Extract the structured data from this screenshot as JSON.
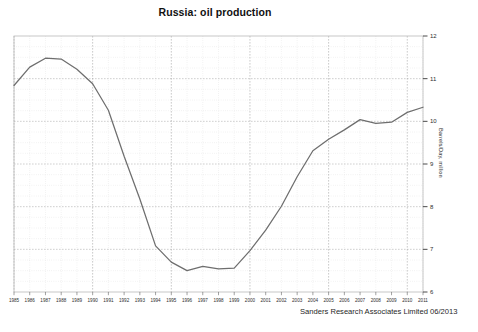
{
  "chart_data": {
    "type": "line",
    "title": "Russia: oil production",
    "xlabel": "",
    "ylabel": "Barrels/Day, million",
    "ylim": [
      6,
      12
    ],
    "xlim": [
      1985,
      2011
    ],
    "ytick_labels": [
      "6",
      "7",
      "8",
      "9",
      "10",
      "11",
      "12"
    ],
    "yticks": [
      6,
      7,
      8,
      9,
      10,
      11,
      12
    ],
    "grid": true,
    "grid_minor": true,
    "legend": "none",
    "series_color": "#6e6e6e",
    "x": [
      1985,
      1986,
      1987,
      1988,
      1989,
      1990,
      1991,
      1992,
      1993,
      1994,
      1995,
      1996,
      1997,
      1998,
      1999,
      2000,
      2001,
      2002,
      2003,
      2004,
      2005,
      2006,
      2007,
      2008,
      2009,
      2010,
      2011
    ],
    "categories": [
      "1985",
      "1986",
      "1987",
      "1988",
      "1989",
      "1990",
      "1991",
      "1992",
      "1993",
      "1994",
      "1995",
      "1996",
      "1997",
      "1998",
      "1999",
      "2000",
      "2001",
      "2002",
      "2003",
      "2004",
      "2005",
      "2006",
      "2007",
      "2008",
      "2009",
      "2010",
      "2011"
    ],
    "values": [
      10.84,
      11.27,
      11.48,
      11.46,
      11.22,
      10.88,
      10.26,
      9.18,
      8.18,
      7.08,
      6.7,
      6.5,
      6.6,
      6.54,
      6.56,
      6.97,
      7.45,
      8.01,
      8.7,
      9.31,
      9.58,
      9.8,
      10.04,
      9.95,
      9.98,
      10.21,
      10.33
    ],
    "annotations": [],
    "source_note": "Sanders Research Associates Limited 06/2013"
  },
  "footer": {
    "credit": "Sanders Research Associates Limited 06/2013"
  },
  "axes": {
    "y_axis_title": "Barrels/Day, million"
  }
}
